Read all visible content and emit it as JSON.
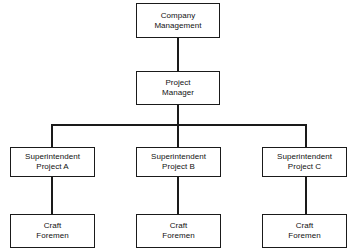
{
  "diagram": {
    "type": "organization-chart",
    "orientation": "top-down",
    "canvas": {
      "width": 357,
      "height": 252
    },
    "levels": 4,
    "nodes": {
      "company_management": {
        "label": "Company\nManagement",
        "line1": "Company",
        "line2": "Management",
        "level": 1
      },
      "project_manager": {
        "label": "Project\nManager",
        "line1": "Project",
        "line2": "Manager",
        "level": 2
      },
      "superintendent_a": {
        "label": "Superintendent\nProject A",
        "line1": "Superintendent",
        "line2": "Project A",
        "level": 3
      },
      "superintendent_b": {
        "label": "Superintendent\nProject B",
        "line1": "Superintendent",
        "line2": "Project B",
        "level": 3
      },
      "superintendent_c": {
        "label": "Superintendent\nProject C",
        "line1": "Superintendent",
        "line2": "Project C",
        "level": 3
      },
      "craft_foremen_a": {
        "label": "Craft\nForemen",
        "line1": "Craft",
        "line2": "Foremen",
        "level": 4
      },
      "craft_foremen_b": {
        "label": "Craft\nForemen",
        "line1": "Craft",
        "line2": "Foremen",
        "level": 4
      },
      "craft_foremen_c": {
        "label": "Craft\nForemen",
        "line1": "Craft",
        "line2": "Foremen",
        "level": 4
      }
    },
    "edges": [
      {
        "from": "company_management",
        "to": "project_manager"
      },
      {
        "from": "project_manager",
        "to": "superintendent_a"
      },
      {
        "from": "project_manager",
        "to": "superintendent_b"
      },
      {
        "from": "project_manager",
        "to": "superintendent_c"
      },
      {
        "from": "superintendent_a",
        "to": "craft_foremen_a"
      },
      {
        "from": "superintendent_b",
        "to": "craft_foremen_b"
      },
      {
        "from": "superintendent_c",
        "to": "craft_foremen_c"
      }
    ],
    "colors": {
      "line": "#1a1a1a",
      "box_border": "#1a1a1a",
      "box_fill": "#ffffff",
      "text": "#111111",
      "background": "#ffffff"
    }
  }
}
